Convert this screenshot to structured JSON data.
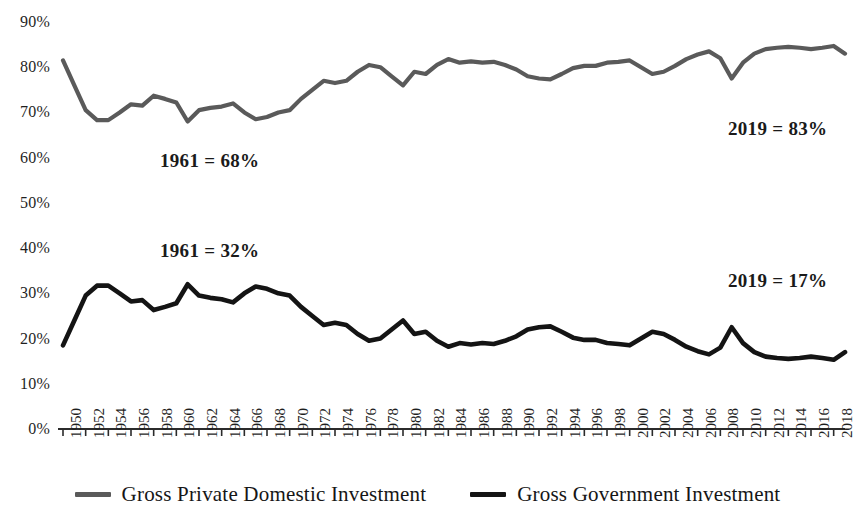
{
  "chart_data": {
    "type": "line",
    "title": "",
    "subtitle": "",
    "xlabel": "",
    "ylabel": "",
    "ylim": [
      0,
      90
    ],
    "ytick_labels": [
      "90%",
      "80%",
      "70%",
      "60%",
      "50%",
      "40%",
      "30%",
      "20%",
      "10%",
      "0%"
    ],
    "ytick_values": [
      90,
      80,
      70,
      60,
      50,
      40,
      30,
      20,
      10,
      0
    ],
    "grid": false,
    "legend_position": "bottom",
    "x": [
      1950,
      1951,
      1952,
      1953,
      1954,
      1955,
      1956,
      1957,
      1958,
      1959,
      1960,
      1961,
      1962,
      1963,
      1964,
      1965,
      1966,
      1967,
      1968,
      1969,
      1970,
      1971,
      1972,
      1973,
      1974,
      1975,
      1976,
      1977,
      1978,
      1979,
      1980,
      1981,
      1982,
      1983,
      1984,
      1985,
      1986,
      1987,
      1988,
      1989,
      1990,
      1991,
      1992,
      1993,
      1994,
      1995,
      1996,
      1997,
      1998,
      1999,
      2000,
      2001,
      2002,
      2003,
      2004,
      2005,
      2006,
      2007,
      2008,
      2009,
      2010,
      2011,
      2012,
      2013,
      2014,
      2015,
      2016,
      2017,
      2018,
      2019
    ],
    "xtick_labels": [
      "1950",
      "1952",
      "1954",
      "1956",
      "1958",
      "1960",
      "1962",
      "1964",
      "1966",
      "1968",
      "1970",
      "1972",
      "1974",
      "1976",
      "1978",
      "1980",
      "1982",
      "1984",
      "1986",
      "1988",
      "1990",
      "1992",
      "1994",
      "1996",
      "1998",
      "2000",
      "2002",
      "2004",
      "2006",
      "2008",
      "2010",
      "2012",
      "2014",
      "2016",
      "2018"
    ],
    "series": [
      {
        "name": "Gross Private Domestic Investment",
        "color": "#5a5a5a",
        "values": [
          81.5,
          76.0,
          70.5,
          68.3,
          68.3,
          70.0,
          71.8,
          71.5,
          73.7,
          73.0,
          72.2,
          68.0,
          70.5,
          71.0,
          71.3,
          72.0,
          70.0,
          68.5,
          69.0,
          70.0,
          70.5,
          73.0,
          75.0,
          77.0,
          76.5,
          77.0,
          79.0,
          80.5,
          80.0,
          78.0,
          76.0,
          79.0,
          78.5,
          80.5,
          81.8,
          81.0,
          81.3,
          81.0,
          81.2,
          80.5,
          79.5,
          78.0,
          77.5,
          77.3,
          78.5,
          79.8,
          80.3,
          80.3,
          81.0,
          81.2,
          81.5,
          80.0,
          78.5,
          79.0,
          80.3,
          81.8,
          82.8,
          83.5,
          82.0,
          77.5,
          81.0,
          83.0,
          84.0,
          84.3,
          84.5,
          84.3,
          84.0,
          84.3,
          84.7,
          83.0
        ]
      },
      {
        "name": "Gross Government Investment",
        "color": "#141414",
        "values": [
          18.5,
          24.0,
          29.5,
          31.7,
          31.7,
          30.0,
          28.2,
          28.5,
          26.3,
          27.0,
          27.8,
          32.0,
          29.5,
          29.0,
          28.7,
          28.0,
          30.0,
          31.5,
          31.0,
          30.0,
          29.5,
          27.0,
          25.0,
          23.0,
          23.5,
          23.0,
          21.0,
          19.5,
          20.0,
          22.0,
          24.0,
          21.0,
          21.5,
          19.5,
          18.2,
          19.0,
          18.7,
          19.0,
          18.8,
          19.5,
          20.5,
          22.0,
          22.5,
          22.7,
          21.5,
          20.2,
          19.7,
          19.7,
          19.0,
          18.8,
          18.5,
          20.0,
          21.5,
          21.0,
          19.7,
          18.2,
          17.2,
          16.5,
          18.0,
          22.5,
          19.0,
          17.0,
          16.0,
          15.7,
          15.5,
          15.7,
          16.0,
          15.7,
          15.3,
          17.0
        ]
      }
    ],
    "annotations": [
      {
        "text": "1961 = 68%",
        "x_px": 160,
        "y_px": 150
      },
      {
        "text": "1961 = 32%",
        "x_px": 160,
        "y_px": 240
      },
      {
        "text": "2019 = 83%",
        "x_px": 728,
        "y_px": 118
      },
      {
        "text": "2019 = 17%",
        "x_px": 728,
        "y_px": 270
      }
    ]
  },
  "axis": {
    "line_color": "#2b2b2b"
  },
  "legend": {
    "entries": [
      {
        "label": "Gross Private Domestic Investment",
        "color": "#5a5a5a"
      },
      {
        "label": "Gross Government Investment",
        "color": "#141414"
      }
    ]
  }
}
